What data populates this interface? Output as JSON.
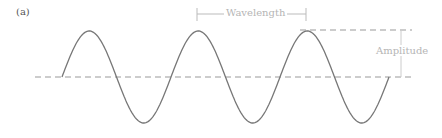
{
  "figure": {
    "panel_label": "(a)",
    "wavelength_label": "Wavelength",
    "amplitude_label": "Amplitude",
    "colors": {
      "wave": "#777777",
      "axis_dash": "#999999",
      "annotation": "#c0c0c0",
      "annotation_text": "#b5b5b5"
    },
    "wave": {
      "type": "sine",
      "cycles": 3,
      "start_x": 62,
      "period_px": 109,
      "baseline_y": 77,
      "amplitude_px": 46
    }
  }
}
